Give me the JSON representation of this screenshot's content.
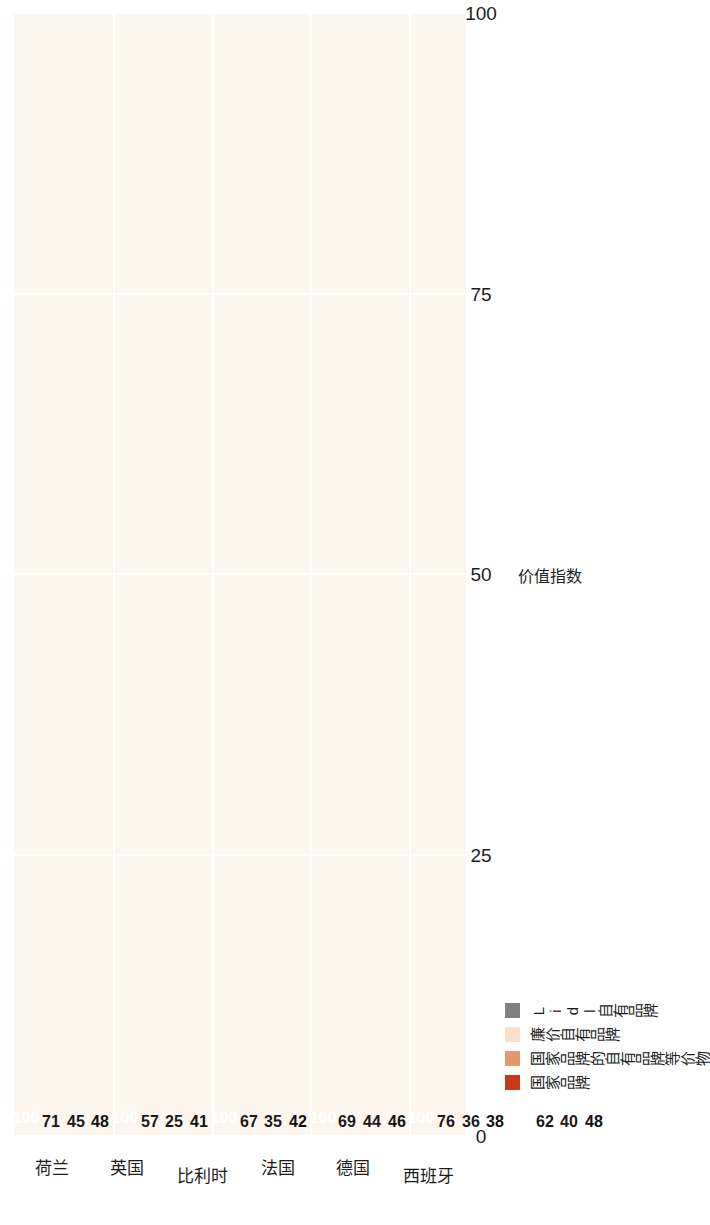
{
  "chart_data": {
    "type": "bar",
    "orientation": "vertical-grouped",
    "title": "",
    "xlabel": "",
    "ylabel": "价值指数",
    "ylim": [
      0,
      100
    ],
    "yticks": [
      "0",
      "25",
      "50",
      "75",
      "100"
    ],
    "grid": true,
    "legend_position": "bottom-left",
    "categories": [
      "荷兰",
      "英国",
      "比利时",
      "法国",
      "德国",
      "西班牙"
    ],
    "series": [
      {
        "name": "国家品牌",
        "color": "#c8381b",
        "values": [
          100,
          100,
          100,
          100,
          100,
          100
        ]
      },
      {
        "name": "国家品牌的自有品牌等价物",
        "color": "#e09a6e",
        "values": [
          71,
          57,
          67,
          69,
          76,
          62
        ]
      },
      {
        "name": "廉价自有品牌",
        "color": "#fadfc9",
        "values": [
          45,
          25,
          35,
          44,
          36,
          40
        ]
      },
      {
        "name": "Lidl自有品牌",
        "color": "#808080",
        "values": [
          48,
          41,
          42,
          46,
          38,
          48
        ]
      }
    ]
  },
  "axis": {
    "y_title": "价值指数",
    "ticks": [
      "0",
      "25",
      "50",
      "75",
      "100"
    ]
  },
  "legend": {
    "items": [
      {
        "label": "国家品牌",
        "color": "#c8381b"
      },
      {
        "label": "国家品牌的自有品牌等价物",
        "color": "#e09a6e"
      },
      {
        "label": "廉价自有品牌",
        "color": "#fadfc9"
      },
      {
        "label": "Lidl自有品牌",
        "color": "#808080"
      }
    ]
  },
  "colors": {
    "plot_background": "#fdf6ee",
    "gridline": "#ffffff",
    "text": "#1c1c1c",
    "label_on_dark": "#ffffff"
  }
}
